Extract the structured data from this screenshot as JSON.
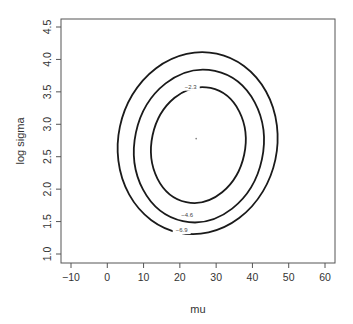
{
  "chart_data": {
    "type": "contour",
    "title": "",
    "xlabel": "mu",
    "ylabel": "log sigma",
    "xlim": [
      -13,
      63
    ],
    "ylim": [
      0.85,
      4.65
    ],
    "x_ticks": [
      -10,
      0,
      10,
      20,
      30,
      40,
      50,
      60
    ],
    "x_tick_labels": [
      "−10",
      "0",
      "10",
      "20",
      "30",
      "40",
      "50",
      "60"
    ],
    "y_ticks": [
      1.0,
      1.5,
      2.0,
      2.5,
      3.0,
      3.5,
      4.0,
      4.5
    ],
    "y_tick_labels": [
      "1.0",
      "1.5",
      "2.0",
      "2.5",
      "3.0",
      "3.5",
      "4.0",
      "4.5"
    ],
    "grid": false,
    "legend": null,
    "maximum_point": {
      "mu": 24.5,
      "log_sigma": 2.78
    },
    "contours": [
      {
        "level": -2.3,
        "label": "−2.3",
        "mu_range": [
          12.2,
          38.0
        ],
        "log_sigma_range": [
          1.78,
          3.58
        ],
        "label_pos": {
          "mu": 23,
          "log_sigma": 3.58
        }
      },
      {
        "level": -4.6,
        "label": "−4.6",
        "mu_range": [
          7.5,
          43.0
        ],
        "log_sigma_range": [
          1.48,
          3.85
        ],
        "label_pos": {
          "mu": 22,
          "log_sigma": 1.6
        }
      },
      {
        "level": -6.9,
        "label": "−6.9",
        "mu_range": [
          3.0,
          46.8
        ],
        "log_sigma_range": [
          1.3,
          4.12
        ],
        "label_pos": {
          "mu": 20.5,
          "log_sigma": 1.37
        }
      }
    ],
    "colors": {
      "contour": "#1a1a1a",
      "axis": "#555555",
      "text": "#333333",
      "point": "#888888"
    }
  }
}
